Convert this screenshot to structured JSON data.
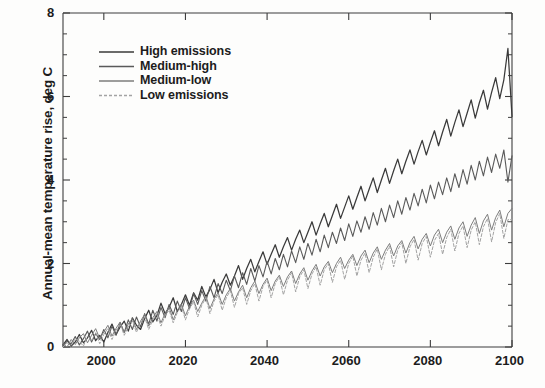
{
  "chart_data": {
    "type": "line",
    "title": "",
    "xlabel": "",
    "ylabel": "Annual-mean temperature rise, deg C",
    "xlim": [
      1990,
      2100
    ],
    "ylim": [
      0,
      8
    ],
    "xticks": [
      2000,
      2020,
      2040,
      2060,
      2080,
      2100
    ],
    "yticks": [
      0,
      2,
      4,
      6,
      8
    ],
    "xtick_labels": [
      "2000",
      "2020",
      "2040",
      "2060",
      "2080",
      "2100"
    ],
    "ytick_labels": [
      "0",
      "2",
      "4",
      "6",
      "8"
    ],
    "minor_ytick_step": 0.5,
    "grid": false,
    "legend_position": "upper-left-inside",
    "x_start": 1990,
    "x_end": 2100,
    "series": [
      {
        "name": "High emissions",
        "color": "#3a3a3a",
        "dash": "none",
        "width": 1.25,
        "values": [
          0.05,
          0.18,
          0.02,
          0.12,
          0.3,
          0.1,
          0.22,
          0.4,
          0.15,
          0.28,
          0.12,
          0.35,
          0.55,
          0.3,
          0.48,
          0.62,
          0.38,
          0.7,
          0.52,
          0.42,
          0.68,
          0.88,
          0.6,
          0.75,
          1.05,
          0.8,
          0.95,
          1.18,
          0.85,
          1.02,
          1.25,
          1.0,
          1.3,
          1.12,
          1.45,
          1.2,
          1.38,
          1.62,
          1.3,
          1.55,
          1.75,
          1.48,
          1.7,
          1.95,
          1.62,
          1.88,
          2.1,
          1.8,
          2.05,
          2.28,
          1.98,
          2.22,
          2.45,
          2.15,
          2.4,
          2.62,
          2.32,
          2.58,
          2.8,
          2.5,
          2.75,
          3.0,
          2.68,
          2.95,
          3.2,
          2.88,
          3.15,
          3.42,
          3.08,
          3.35,
          3.62,
          3.3,
          3.58,
          3.85,
          3.5,
          3.78,
          4.05,
          3.7,
          4.0,
          4.28,
          3.92,
          4.22,
          4.5,
          4.15,
          4.45,
          4.72,
          4.38,
          4.68,
          4.95,
          4.6,
          4.9,
          5.18,
          4.82,
          5.15,
          5.45,
          5.05,
          5.38,
          5.68,
          5.28,
          5.6,
          5.92,
          5.48,
          5.85,
          6.15,
          5.7,
          6.1,
          6.45,
          5.95,
          6.4,
          7.15,
          5.52
        ]
      },
      {
        "name": "Medium-high",
        "color": "#5a5a5a",
        "dash": "none",
        "width": 1.1,
        "values": [
          0.02,
          0.14,
          0.08,
          0.25,
          0.05,
          0.2,
          0.38,
          0.12,
          0.32,
          0.18,
          0.42,
          0.22,
          0.5,
          0.28,
          0.58,
          0.35,
          0.65,
          0.42,
          0.72,
          0.48,
          0.8,
          0.55,
          0.88,
          0.62,
          0.95,
          0.7,
          1.02,
          0.78,
          1.1,
          0.85,
          1.18,
          0.92,
          1.28,
          1.02,
          1.35,
          1.1,
          1.45,
          1.18,
          1.52,
          1.28,
          1.6,
          1.35,
          1.7,
          1.42,
          1.78,
          1.5,
          1.88,
          1.58,
          1.95,
          1.68,
          2.05,
          1.75,
          2.12,
          1.85,
          2.22,
          1.92,
          2.3,
          2.02,
          2.4,
          2.1,
          2.48,
          2.2,
          2.58,
          2.28,
          2.68,
          2.38,
          2.75,
          2.48,
          2.85,
          2.55,
          2.95,
          2.65,
          3.02,
          2.75,
          3.12,
          2.82,
          3.22,
          2.92,
          3.32,
          3.0,
          3.4,
          3.1,
          3.5,
          3.18,
          3.58,
          3.28,
          3.68,
          3.38,
          3.78,
          3.45,
          3.88,
          3.55,
          3.95,
          3.65,
          4.05,
          3.72,
          4.15,
          3.82,
          4.25,
          3.9,
          4.35,
          4.0,
          4.45,
          4.1,
          4.55,
          4.18,
          4.62,
          4.28,
          4.72,
          3.95,
          4.58
        ]
      },
      {
        "name": "Medium-low",
        "color": "#7d7d7d",
        "dash": "none",
        "width": 1.0,
        "values": [
          0.08,
          0.0,
          0.18,
          0.06,
          0.22,
          0.32,
          0.1,
          0.28,
          0.44,
          0.2,
          0.36,
          0.52,
          0.26,
          0.45,
          0.6,
          0.34,
          0.55,
          0.68,
          0.42,
          0.62,
          0.78,
          0.5,
          0.7,
          0.85,
          0.58,
          0.8,
          0.95,
          0.65,
          0.88,
          1.02,
          0.75,
          0.98,
          1.12,
          0.85,
          1.05,
          1.22,
          0.92,
          1.15,
          1.3,
          1.02,
          1.25,
          1.4,
          1.1,
          1.32,
          1.48,
          1.18,
          1.42,
          1.58,
          1.28,
          1.5,
          1.65,
          1.35,
          1.58,
          1.72,
          1.45,
          1.68,
          1.82,
          1.52,
          1.75,
          1.9,
          1.6,
          1.82,
          1.98,
          1.7,
          1.92,
          2.05,
          1.78,
          2.0,
          2.15,
          1.88,
          2.08,
          2.22,
          1.95,
          2.18,
          2.32,
          2.02,
          2.25,
          2.4,
          2.1,
          2.32,
          2.48,
          2.18,
          2.42,
          2.55,
          2.25,
          2.5,
          2.65,
          2.35,
          2.58,
          2.72,
          2.42,
          2.68,
          2.82,
          2.5,
          2.75,
          2.9,
          2.58,
          2.85,
          3.0,
          2.65,
          2.92,
          3.1,
          2.72,
          3.02,
          3.18,
          2.8,
          3.1,
          3.28,
          2.88,
          3.2,
          3.32
        ]
      },
      {
        "name": "Low emissions",
        "color": "#a3a3a3",
        "dash": "3,2",
        "width": 1.0,
        "values": [
          0.0,
          0.1,
          0.04,
          0.2,
          0.14,
          0.02,
          0.26,
          0.16,
          0.34,
          0.08,
          0.3,
          0.45,
          0.18,
          0.4,
          0.55,
          0.28,
          0.48,
          0.62,
          0.35,
          0.58,
          0.72,
          0.42,
          0.65,
          0.8,
          0.5,
          0.75,
          0.88,
          0.58,
          0.82,
          0.98,
          0.65,
          0.92,
          1.08,
          0.72,
          1.0,
          1.18,
          0.8,
          1.1,
          1.25,
          0.88,
          1.18,
          1.35,
          0.95,
          1.28,
          1.42,
          1.02,
          1.35,
          1.52,
          1.1,
          1.45,
          1.6,
          1.18,
          1.52,
          1.68,
          1.25,
          1.6,
          1.78,
          1.32,
          1.68,
          1.85,
          1.4,
          1.75,
          1.92,
          1.48,
          1.85,
          2.0,
          1.55,
          1.92,
          2.08,
          1.62,
          2.0,
          2.18,
          1.7,
          2.08,
          2.25,
          1.78,
          2.15,
          2.35,
          1.85,
          2.22,
          2.42,
          1.92,
          2.32,
          2.5,
          2.0,
          2.4,
          2.58,
          2.08,
          2.48,
          2.65,
          2.15,
          2.55,
          2.72,
          2.22,
          2.62,
          2.82,
          2.3,
          2.72,
          2.9,
          2.38,
          2.8,
          3.0,
          2.45,
          2.88,
          3.08,
          2.52,
          2.98,
          3.2,
          2.6,
          3.05,
          3.05
        ]
      }
    ]
  },
  "legend": {
    "entries": [
      {
        "label": "High emissions"
      },
      {
        "label": "Medium-high"
      },
      {
        "label": "Medium-low"
      },
      {
        "label": "Low emissions"
      }
    ]
  },
  "axes": {
    "y_axis_title": "Annual-mean temperature rise, deg C"
  }
}
